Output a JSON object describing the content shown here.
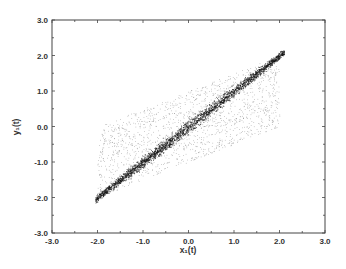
{
  "chart_data": {
    "type": "scatter",
    "title": "",
    "xlabel": "x₁(t)",
    "ylabel": "y₁(t)",
    "xlim": [
      -3.0,
      3.0
    ],
    "ylim": [
      -3.0,
      3.0
    ],
    "x_ticks": [
      "-3.0",
      "-2.0",
      "-1.0",
      "0.0",
      "1.0",
      "2.0",
      "3.0"
    ],
    "y_ticks": [
      "3.0",
      "2.0",
      "1.0",
      "0.0",
      "-1.0",
      "-2.0",
      "-3.0"
    ],
    "grid": false,
    "legend": null,
    "series": [
      {
        "name": "synchronized band",
        "description": "dense points along y = x",
        "x_range": [
          -2.05,
          2.1
        ],
        "relation": "y = x",
        "spread": 0.08,
        "count": 2600,
        "color": "#111111"
      },
      {
        "name": "diffuse cloud",
        "description": "sparse points scattered around the diagonal",
        "x_range": [
          -2.0,
          2.0
        ],
        "relation": "y = 0.5*x",
        "spread": 1.0,
        "count": 1500,
        "color": "#555555"
      }
    ]
  },
  "colors": {
    "axis": "#444444",
    "text": "#333333",
    "background": "#ffffff"
  }
}
